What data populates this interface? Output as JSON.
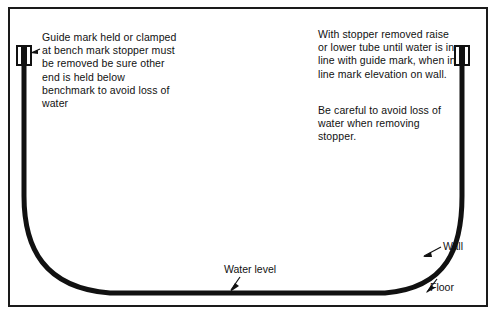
{
  "diagram": {
    "frame": {
      "border_color": "#1a1a1a"
    },
    "tube": {
      "color": "#111111",
      "left_stopper_label": "left-stopper",
      "right_stopper_label": "right-stopper"
    },
    "notes": {
      "left": "Guide mark held or clamped at bench mark stopper must be removed be sure other end is held below benchmark to avoid loss of water",
      "right_top": "With stopper removed raise or lower tube until water is in line with guide mark, when in line mark elevation on wall.",
      "right_bottom": "Be careful to avoid loss of water when removing stopper."
    },
    "labels": {
      "wall": "Wall",
      "floor": "Floor",
      "water_level": "Water level"
    }
  }
}
